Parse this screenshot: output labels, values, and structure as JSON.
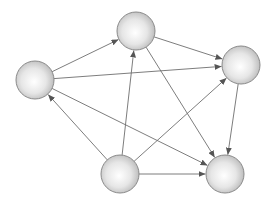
{
  "diagram": {
    "type": "directed-graph",
    "background": "#ffffff",
    "edge_color": "#6e6e6e",
    "node_style": {
      "fill_center": "#ffffff",
      "fill_edge": "#b4b4b4",
      "stroke": "#8a8a8a",
      "radius": 19
    },
    "nodes": [
      {
        "id": "A",
        "x": 35,
        "y": 80
      },
      {
        "id": "B",
        "x": 136,
        "y": 31
      },
      {
        "id": "C",
        "x": 241,
        "y": 65
      },
      {
        "id": "D",
        "x": 120,
        "y": 174
      },
      {
        "id": "E",
        "x": 225,
        "y": 174
      }
    ],
    "edges": [
      {
        "from": "A",
        "to": "B"
      },
      {
        "from": "A",
        "to": "C"
      },
      {
        "from": "A",
        "to": "E"
      },
      {
        "from": "B",
        "to": "C"
      },
      {
        "from": "B",
        "to": "E"
      },
      {
        "from": "C",
        "to": "E"
      },
      {
        "from": "D",
        "to": "A"
      },
      {
        "from": "D",
        "to": "B"
      },
      {
        "from": "D",
        "to": "C"
      },
      {
        "from": "D",
        "to": "E"
      }
    ]
  }
}
